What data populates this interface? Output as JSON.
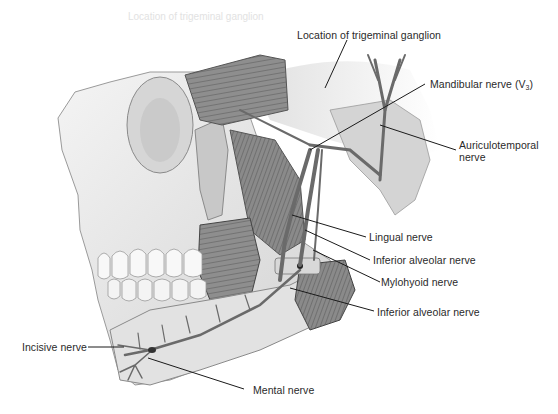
{
  "figure": {
    "labels": {
      "trigeminal_ganglion": "Location of trigeminal ganglion",
      "mandibular_nerve": "Mandibular nerve (V",
      "mandibular_nerve_sub": "3",
      "mandibular_nerve_close": ")",
      "auriculotemporal_line1": "Auriculotemporal",
      "auriculotemporal_line2": "nerve",
      "lingual": "Lingual nerve",
      "inferior_alveolar_upper": "Inferior alveolar nerve",
      "mylohyoid": "Mylohyoid nerve",
      "inferior_alveolar_lower": "Inferior alveolar nerve",
      "incisive": "Incisive nerve",
      "mental": "Mental nerve"
    },
    "faded_header_text": "Location of trigeminal ganglion",
    "colors": {
      "background": "#ffffff",
      "bone": "#e6e6e6",
      "bone_shadow": "#b8b8b8",
      "muscle": "#8a8a8a",
      "nerve": "#6a6a6a",
      "leader_line": "#1a1a1a",
      "text": "#2a2a2a"
    }
  }
}
